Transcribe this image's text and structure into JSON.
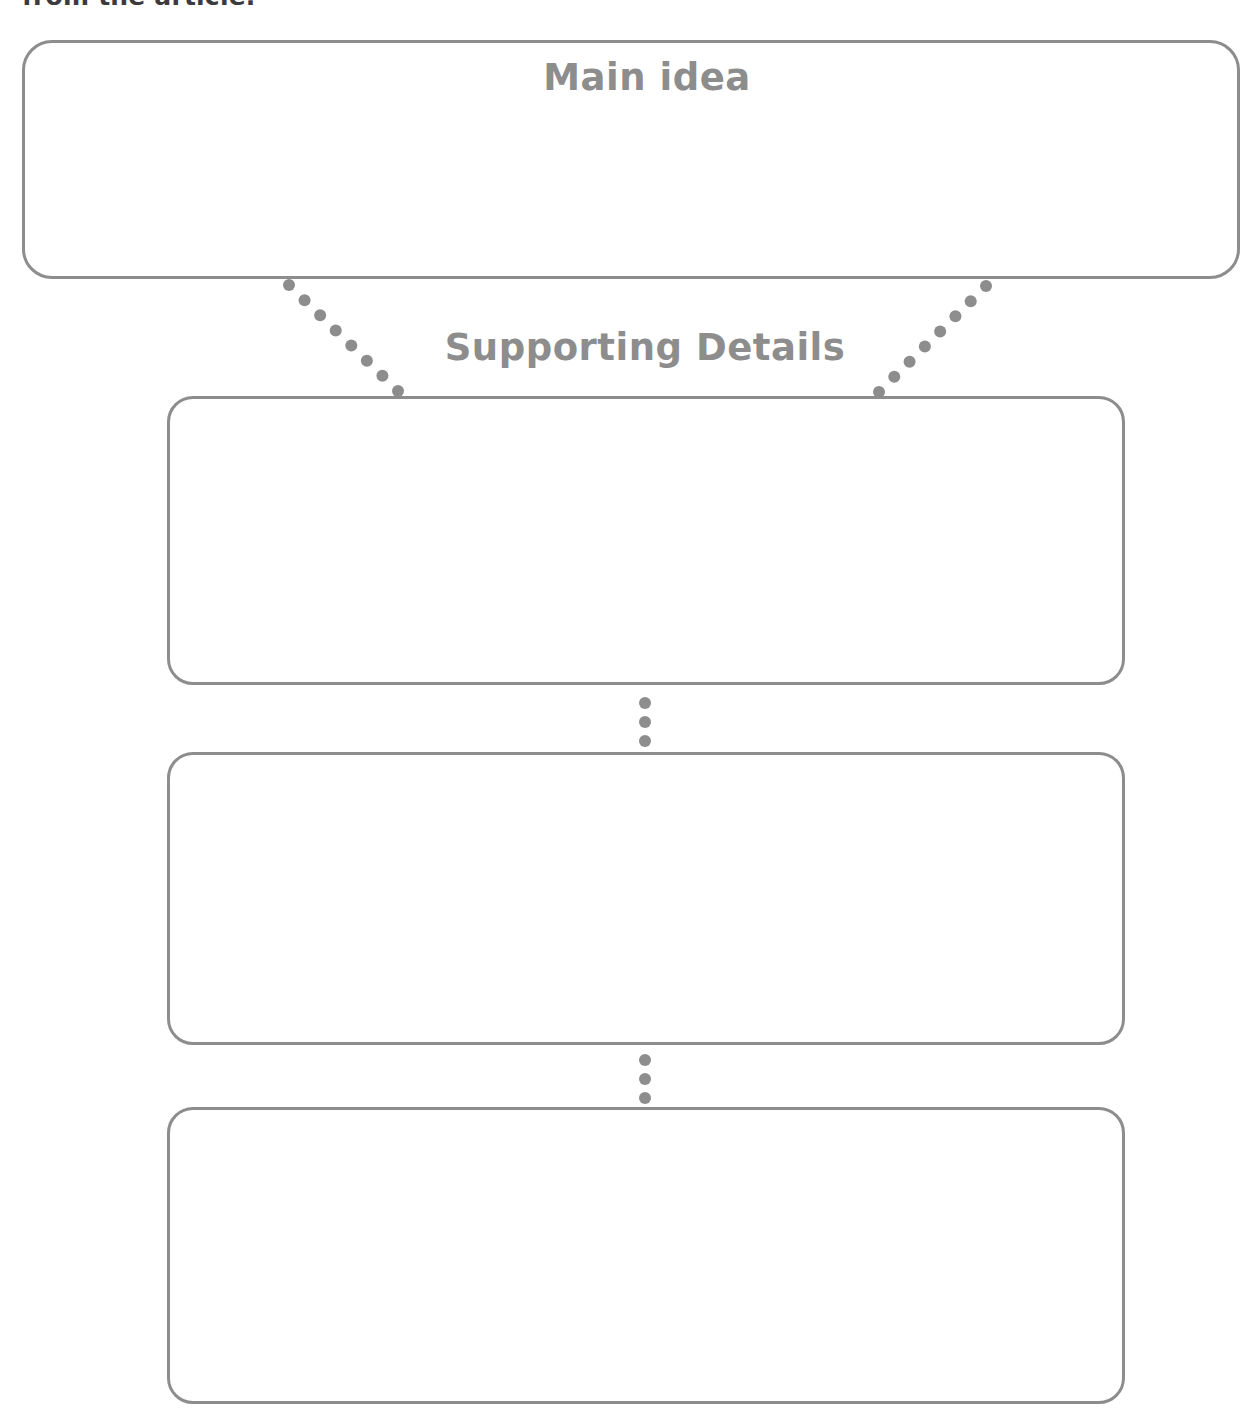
{
  "page": {
    "width": 1190,
    "height": 1414,
    "background_color": "#ffffff",
    "line_color": "#8d8d8d",
    "text_color": "#8d8d8d",
    "instruction_text_color": "#3b3b3f"
  },
  "instruction": {
    "text": "from the article.",
    "note": "clipped at the very top edge of the screenshot"
  },
  "organizer": {
    "main_idea": {
      "label": "Main idea",
      "placeholder_text": ""
    },
    "supporting_details": {
      "label": "Supporting Details",
      "boxes": [
        {
          "id": "detail-1",
          "value": ""
        },
        {
          "id": "detail-2",
          "value": ""
        },
        {
          "id": "detail-3",
          "value": ""
        }
      ]
    }
  },
  "connectors": {
    "dot_color": "#8d8d8d",
    "dot_radius": 6,
    "branch_left": {
      "from": [
        289,
        285
      ],
      "to": [
        398,
        391
      ],
      "dots": 8
    },
    "branch_right": {
      "from": [
        986,
        286
      ],
      "to": [
        879,
        392
      ],
      "dots": 8
    },
    "chain_1_2": {
      "x": 645,
      "from_y": 703,
      "to_y": 741,
      "dots": 3
    },
    "chain_2_3": {
      "x": 645,
      "from_y": 1060,
      "to_y": 1098,
      "dots": 3
    }
  }
}
